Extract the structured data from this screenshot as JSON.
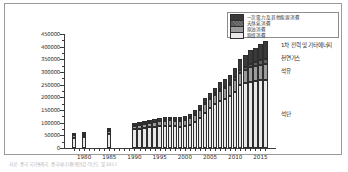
{
  "figure": {
    "caption": "자료: 중국 국가통계국, 중국에너지통계연감 각년도 및 2017"
  },
  "chart_data": {
    "type": "bar",
    "stacked": true,
    "title": "",
    "xlabel": "",
    "ylabel": "",
    "ylim": [
      0,
      450000
    ],
    "ytick_step": 50000,
    "grid": false,
    "legend_position": "top-right",
    "ytick_labels": [
      "450000",
      "400000",
      "350000",
      "300000",
      "250000",
      "200000",
      "150000",
      "100000",
      "50000",
      "0"
    ],
    "ytick_values": [
      450000,
      400000,
      350000,
      300000,
      250000,
      200000,
      150000,
      100000,
      50000,
      0
    ],
    "xtick_labels": [
      "1980",
      "1985",
      "1990",
      "1995",
      "2000",
      "2005",
      "2010",
      "2015"
    ],
    "xtick_values": [
      1980,
      1985,
      1990,
      1995,
      2000,
      2005,
      2010,
      2015
    ],
    "categories": [
      1978,
      1980,
      1985,
      1990,
      1991,
      1992,
      1993,
      1994,
      1995,
      1996,
      1997,
      1998,
      1999,
      2000,
      2001,
      2002,
      2003,
      2004,
      2005,
      2006,
      2007,
      2008,
      2009,
      2010,
      2011,
      2012,
      2013,
      2014,
      2015,
      2016
    ],
    "series": [
      {
        "name": "석탄소비",
        "legend_label": "原煤消費",
        "annotation": "석탄",
        "color": "#e9e9e9",
        "values": [
          40500,
          43000,
          56000,
          74000,
          77000,
          79000,
          81000,
          84000,
          87000,
          88000,
          88000,
          85000,
          84000,
          86000,
          92000,
          101000,
          120000,
          140000,
          157000,
          172000,
          186000,
          194000,
          205000,
          221000,
          247000,
          255000,
          262000,
          264000,
          268000,
          270000
        ]
      },
      {
        "name": "석유소비",
        "legend_label": "原油消費",
        "annotation": "석유",
        "color": "#9b9b9b",
        "values": [
          9000,
          10000,
          12000,
          14000,
          15000,
          16000,
          18000,
          18000,
          19000,
          20000,
          22000,
          22000,
          24000,
          26000,
          27000,
          29000,
          31000,
          35000,
          36000,
          38000,
          40000,
          41000,
          44000,
          48000,
          50000,
          53000,
          56000,
          58000,
          61000,
          63000
        ]
      },
      {
        "name": "천연가스소비",
        "legend_label": "天然氣消費",
        "annotation": "천연가스",
        "color": "#5e5e5e",
        "values": [
          1500,
          1600,
          1800,
          2000,
          2100,
          2200,
          2300,
          2400,
          2500,
          2600,
          2800,
          2900,
          3000,
          3200,
          3400,
          3700,
          4000,
          4500,
          5000,
          5800,
          6800,
          7600,
          8400,
          10000,
          11500,
          13000,
          14500,
          16000,
          17000,
          18500
        ]
      },
      {
        "name": "1차전력및기타에너지소비",
        "legend_label": "一次電力及其他能源消費",
        "annotation": "1차 전력 및 기타에너지",
        "color": "#3a3a3a",
        "values": [
          4000,
          4500,
          5500,
          7000,
          7500,
          8000,
          8500,
          9000,
          9500,
          10000,
          10500,
          11000,
          11500,
          12500,
          13500,
          14500,
          16000,
          18000,
          20000,
          23000,
          26000,
          29000,
          32000,
          37000,
          42000,
          47000,
          53000,
          58000,
          64000,
          70000
        ]
      }
    ]
  }
}
